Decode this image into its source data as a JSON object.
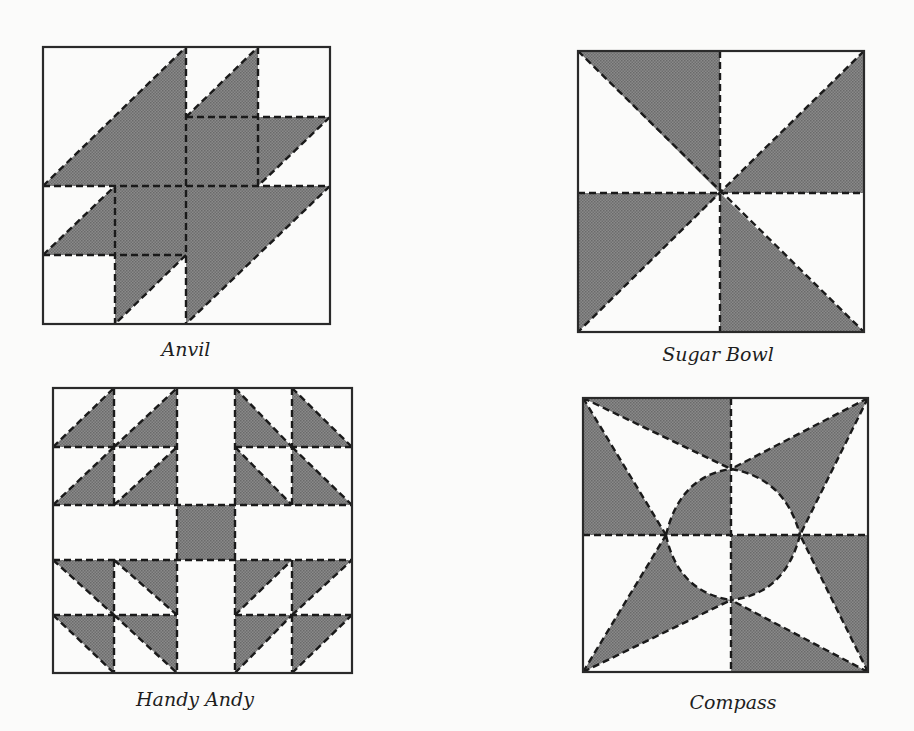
{
  "colors": {
    "paper": "#fbfbfa",
    "shade": "#7d7d7d",
    "ink": "#1a1a1a"
  },
  "blocks": [
    {
      "id": "anvil",
      "caption": "Anvil",
      "box": [
        43,
        47,
        330,
        324
      ],
      "caption_pos": [
        186,
        352
      ]
    },
    {
      "id": "sugar-bowl",
      "caption": "Sugar Bowl",
      "box": [
        578,
        51,
        864,
        332
      ],
      "caption_pos": [
        718,
        357
      ]
    },
    {
      "id": "handy-andy",
      "caption": "Handy Andy",
      "box": [
        53,
        388,
        352,
        673
      ],
      "caption_pos": [
        195,
        702
      ]
    },
    {
      "id": "compass",
      "caption": "Compass",
      "box": [
        583,
        398,
        868,
        672
      ],
      "caption_pos": [
        733,
        705
      ]
    }
  ]
}
